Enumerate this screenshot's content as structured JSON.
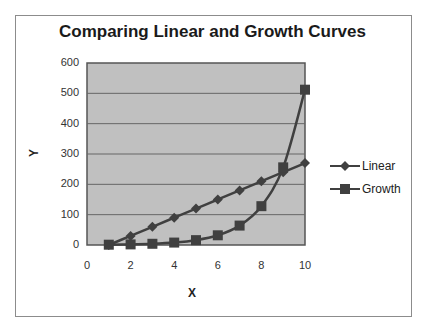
{
  "chart_data": {
    "type": "scatter",
    "subtype": "line-with-markers",
    "title": "Comparing Linear and Growth Curves",
    "xlabel": "X",
    "ylabel": "Y",
    "xlim": [
      0,
      10
    ],
    "ylim": [
      0,
      600
    ],
    "x_ticks": [
      "0",
      "2",
      "4",
      "6",
      "8",
      "10"
    ],
    "y_ticks": [
      "0",
      "100",
      "200",
      "300",
      "400",
      "500",
      "600"
    ],
    "grid": "horizontal major gridlines",
    "legend_position": "right",
    "plot_background": "#c0c0c0",
    "x": [
      1,
      2,
      3,
      4,
      5,
      6,
      7,
      8,
      9,
      10
    ],
    "series": [
      {
        "name": "Linear",
        "marker": "diamond",
        "color": "#404040",
        "values": [
          0,
          30,
          60,
          90,
          120,
          150,
          180,
          210,
          240,
          270
        ]
      },
      {
        "name": "Growth",
        "marker": "square",
        "color": "#404040",
        "values": [
          1,
          2,
          4,
          8,
          16,
          32,
          64,
          128,
          256,
          512
        ]
      }
    ]
  }
}
